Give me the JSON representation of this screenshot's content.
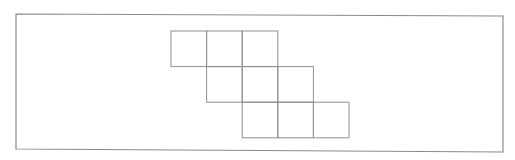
{
  "diagram": {
    "type": "square-grid-net",
    "colors": {
      "background": "#ffffff",
      "frame_stroke": "#8a8a8a",
      "grid_stroke": "#8f8f8f"
    },
    "frame": {
      "points": [
        [
          16,
          14
        ],
        [
          503,
          16
        ],
        [
          503,
          152
        ],
        [
          16,
          149
        ]
      ]
    },
    "unit": 35.6,
    "origin": [
      171,
      31
    ],
    "rows": [
      {
        "row": 0,
        "start_col": 0,
        "cells": 3
      },
      {
        "row": 1,
        "start_col": 1,
        "cells": 3
      },
      {
        "row": 2,
        "start_col": 2,
        "cells": 3
      }
    ]
  }
}
